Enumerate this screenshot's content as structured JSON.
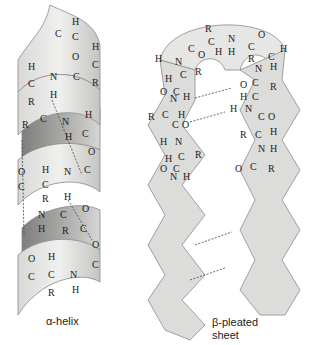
{
  "figure": {
    "panels": [
      {
        "id": "alpha-helix",
        "caption": "α-helix",
        "structure": "coiled ribbon with backbone atoms C, N, H, O, R and dashed hydrogen bonds between N-H and C=O"
      },
      {
        "id": "beta-sheet",
        "caption_line1": "β-pleated",
        "caption_line2": "sheet",
        "structure": "two antiparallel zigzag strands joined by a hairpin turn, with dashed hydrogen bonds between C=O and H-N"
      }
    ],
    "colors": {
      "ribbon_light": "#e8e8e6",
      "ribbon_mid": "#d2d2d0",
      "ribbon_dark": "#9a9a98",
      "outline": "#8a8a88",
      "text": "#222222"
    }
  }
}
